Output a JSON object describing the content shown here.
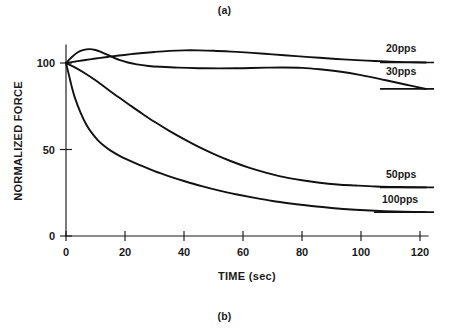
{
  "figure": {
    "caption_top": "(a)",
    "caption_bottom": "(b)"
  },
  "chart_data": {
    "type": "line",
    "title": "",
    "xlabel": "TIME (sec)",
    "ylabel": "NORMALIZED FORCE",
    "xlim": [
      0,
      123
    ],
    "ylim": [
      0,
      112
    ],
    "xticks": [
      0,
      20,
      40,
      60,
      80,
      100,
      120
    ],
    "xticklabels": [
      "0",
      "20",
      "40",
      "60",
      "80",
      "100",
      "120"
    ],
    "yticks": [
      0,
      50,
      100
    ],
    "yticklabels": [
      "0",
      "50",
      "100"
    ],
    "grid": false,
    "legend_position": "right-inline-labels",
    "line_color": "#111111",
    "series": [
      {
        "name": "20pps",
        "label": "20pps",
        "x": [
          0,
          3,
          6,
          10,
          14,
          18,
          22,
          26,
          30,
          35,
          40,
          45,
          50,
          56,
          62,
          70,
          78,
          86,
          94,
          102,
          110,
          116,
          122
        ],
        "values": [
          100,
          100.8,
          101.6,
          102.6,
          103.5,
          104.3,
          105.1,
          105.8,
          106.4,
          107.0,
          107.3,
          107.3,
          107.1,
          106.6,
          106.0,
          105.0,
          104.0,
          103.0,
          102.1,
          101.4,
          100.8,
          100.5,
          100.3
        ]
      },
      {
        "name": "30pps",
        "label": "30pps",
        "x": [
          0,
          2,
          4,
          6,
          8,
          10,
          12,
          14,
          16,
          18,
          21,
          24,
          28,
          32,
          38,
          45,
          52,
          60,
          68,
          74,
          80,
          86,
          92,
          100,
          108,
          115,
          122
        ],
        "values": [
          100,
          103.5,
          106.2,
          107.6,
          108.0,
          107.5,
          106.3,
          104.8,
          103.2,
          101.8,
          100.3,
          99.2,
          98.3,
          97.8,
          97.3,
          97.0,
          96.9,
          97.0,
          97.3,
          97.4,
          97.2,
          96.4,
          95.2,
          93.0,
          90.2,
          87.6,
          85.0
        ]
      },
      {
        "name": "50pps",
        "label": "50pps",
        "x": [
          0,
          3,
          6,
          10,
          14,
          18,
          22,
          26,
          30,
          35,
          40,
          45,
          50,
          56,
          62,
          68,
          74,
          80,
          86,
          92,
          98,
          105,
          112,
          122
        ],
        "values": [
          100,
          97.5,
          94.5,
          90.0,
          85.0,
          80.0,
          75.2,
          70.5,
          66.0,
          60.8,
          56.0,
          51.5,
          47.5,
          43.2,
          39.5,
          36.5,
          34.0,
          32.2,
          30.8,
          29.8,
          29.2,
          28.6,
          28.3,
          28.1
        ]
      },
      {
        "name": "100pps",
        "label": "100pps",
        "x": [
          0,
          1,
          2,
          3,
          5,
          7,
          9,
          11,
          13,
          15,
          18,
          21,
          25,
          30,
          35,
          40,
          46,
          52,
          58,
          64,
          70,
          76,
          82,
          90,
          98,
          108,
          122
        ],
        "values": [
          100,
          93.0,
          86.0,
          80.0,
          71.0,
          64.0,
          59.0,
          55.0,
          52.0,
          49.5,
          46.5,
          44.0,
          41.0,
          37.5,
          34.5,
          31.8,
          28.8,
          26.2,
          24.0,
          22.0,
          20.2,
          18.8,
          17.6,
          16.2,
          15.2,
          14.4,
          13.8
        ]
      }
    ]
  }
}
